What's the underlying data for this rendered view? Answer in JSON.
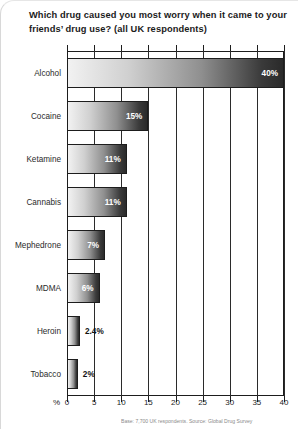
{
  "title": "Which drug caused you most worry when it came to your friends’ drug use? (all UK respondents)",
  "footnote": "Base: 7,700 UK respondents. Source: Global Drug Survey",
  "axis": {
    "percent_symbol": "%",
    "ticks": [
      "0",
      "5",
      "10",
      "15",
      "20",
      "25",
      "30",
      "35",
      "40"
    ]
  },
  "chart_data": {
    "type": "bar",
    "orientation": "horizontal",
    "title": "Which drug caused you most worry when it came to your friends’ drug use? (all UK respondents)",
    "xlabel": "%",
    "ylabel": "",
    "xlim": [
      0,
      40
    ],
    "xticks": [
      0,
      5,
      10,
      15,
      20,
      25,
      30,
      35,
      40
    ],
    "grid": true,
    "legend": false,
    "categories": [
      "Alcohol",
      "Cocaine",
      "Ketamine",
      "Cannabis",
      "Mephedrone",
      "MDMA",
      "Heroin",
      "Tobacco"
    ],
    "values": [
      40,
      15,
      11,
      11,
      7,
      6,
      2.4,
      2
    ],
    "data_labels": [
      "40%",
      "15%",
      "11%",
      "11%",
      "7%",
      "6%",
      "2.4%",
      "2%"
    ],
    "label_placement": [
      "inside",
      "inside",
      "inside",
      "inside",
      "inside",
      "inside",
      "outside",
      "outside"
    ],
    "bar_fill": "linear-gradient light-grey to black",
    "colors": {
      "bar_start": "#f2f2f2",
      "bar_end": "#2a2a2a",
      "axis": "#1d1d1d",
      "label_inside": "#ffffff",
      "label_outside": "#111111"
    }
  }
}
